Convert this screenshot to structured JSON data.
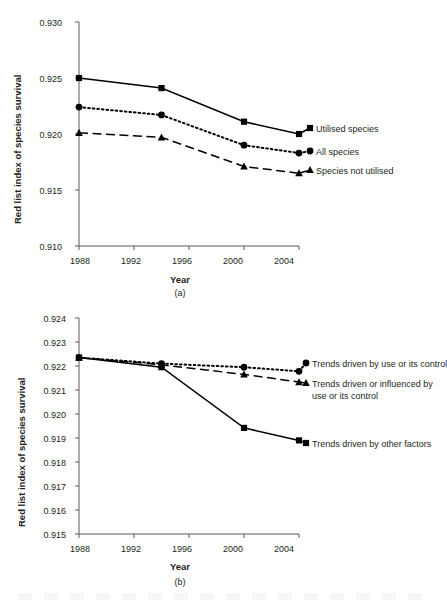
{
  "figure": {
    "background": "#ffffff",
    "ink": "#231f20"
  },
  "chart_data": [
    {
      "id": "panel-a",
      "type": "line",
      "title": "",
      "panel_label": "(a)",
      "xlabel": "Year",
      "ylabel": "Red list index of species survival",
      "x": [
        1988,
        1994,
        2000,
        2004
      ],
      "xlim": [
        1988,
        2004
      ],
      "xticks": [
        1988,
        1992,
        1996,
        2000,
        2004
      ],
      "xtick_labels": [
        "1988",
        "1992",
        "1996",
        "2000",
        "2004"
      ],
      "ylim": [
        0.91,
        0.93
      ],
      "yticks": [
        0.91,
        0.915,
        0.92,
        0.925,
        0.93
      ],
      "ytick_labels": [
        "0.910",
        "0.915",
        "0.920",
        "0.925",
        "0.930"
      ],
      "grid": false,
      "legend_position": "right-inline",
      "series": [
        {
          "name": "Utilised species",
          "marker": "square",
          "line": "solid",
          "color": "#000000",
          "values": [
            0.925,
            0.9241,
            0.9211,
            0.92
          ]
        },
        {
          "name": "All species",
          "marker": "circle",
          "line": "dotted",
          "color": "#000000",
          "values": [
            0.9224,
            0.9217,
            0.919,
            0.9183
          ]
        },
        {
          "name": "Species not utilised",
          "marker": "triangle",
          "line": "dashed",
          "color": "#000000",
          "values": [
            0.9201,
            0.9197,
            0.9171,
            0.9165
          ]
        }
      ]
    },
    {
      "id": "panel-b",
      "type": "line",
      "title": "",
      "panel_label": "(b)",
      "xlabel": "Year",
      "ylabel": "Red list index of species survival",
      "x": [
        1988,
        1994,
        2000,
        2004
      ],
      "xlim": [
        1988,
        2004
      ],
      "xticks": [
        1988,
        1992,
        1996,
        2000,
        2004
      ],
      "xtick_labels": [
        "1988",
        "1992",
        "1996",
        "2000",
        "2004"
      ],
      "ylim": [
        0.915,
        0.924
      ],
      "yticks": [
        0.915,
        0.916,
        0.917,
        0.918,
        0.919,
        0.92,
        0.921,
        0.922,
        0.923,
        0.924
      ],
      "ytick_labels": [
        "0.915",
        "0.916",
        "0.917",
        "0.918",
        "0.919",
        "0.920",
        "0.921",
        "0.922",
        "0.923",
        "0.924"
      ],
      "grid": false,
      "legend_position": "right-inline",
      "series": [
        {
          "name": "Trends driven by use or its control",
          "name_lines": [
            "Trends driven by use or its control"
          ],
          "marker": "circle",
          "line": "dotted",
          "color": "#000000",
          "values": [
            0.92235,
            0.9221,
            0.92195,
            0.92178
          ]
        },
        {
          "name": "Trends driven or influenced by use or its control",
          "name_lines": [
            "Trends driven or influenced by",
            "use or its control"
          ],
          "marker": "triangle",
          "line": "dashed",
          "color": "#000000",
          "values": [
            0.92235,
            0.92205,
            0.92165,
            0.92133
          ]
        },
        {
          "name": "Trends driven by other factors",
          "name_lines": [
            "Trends driven by other factors"
          ],
          "marker": "square",
          "line": "solid",
          "color": "#000000",
          "values": [
            0.92235,
            0.92195,
            0.91942,
            0.9189
          ]
        }
      ]
    }
  ]
}
